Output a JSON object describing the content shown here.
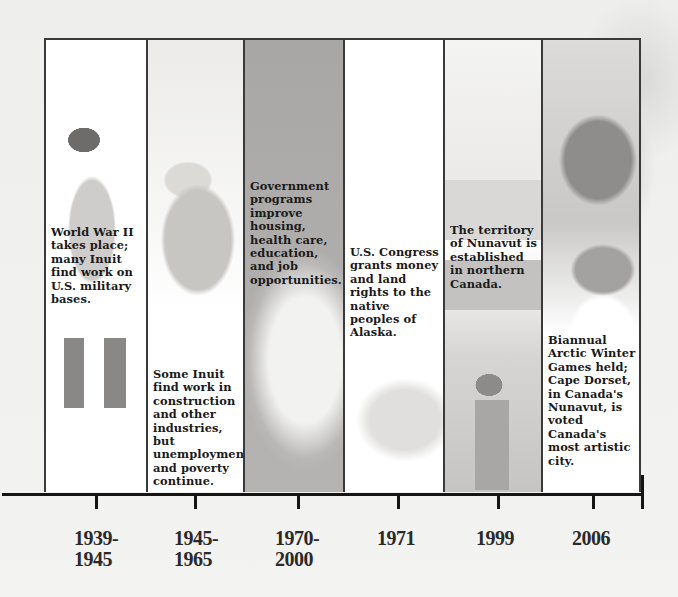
{
  "timeline": {
    "events": [
      {
        "id": "1939-1945",
        "year_label": "1939-\n1945",
        "text": "World War II takes place; many Inuit find work on U.S. military bases."
      },
      {
        "id": "1945-1965",
        "year_label": "1945-\n1965",
        "text": "Some Inuit find work in construction and other industries, but unemployment and poverty continue."
      },
      {
        "id": "1970-2000",
        "year_label": "1970-\n2000",
        "text": "Government programs improve housing, health care, education, and job opportunities."
      },
      {
        "id": "1971",
        "year_label": "1971",
        "text": "U.S. Congress grants money and land rights to the native peoples of Alaska."
      },
      {
        "id": "1999",
        "year_label": "1999",
        "text": "The territory of Nunavut is established in northern Canada."
      },
      {
        "id": "2006",
        "year_label": "2006",
        "text": "Biannual Arctic Winter Games held; Cape Dorset, in Canada's Nunavut, is voted Canada's most artistic city."
      }
    ]
  },
  "colors": {
    "border": "#3a3a3a",
    "axis": "#151515",
    "text": "#1a1a1a",
    "background": "#f2f1ef"
  }
}
